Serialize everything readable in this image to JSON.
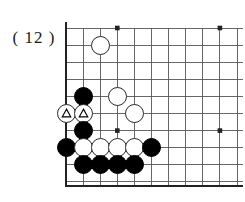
{
  "figure": {
    "label": "( 12 )",
    "type": "go-board-diagram"
  },
  "board": {
    "size_label": "19x19",
    "visible_cols": 11,
    "visible_rows": 10,
    "shows_corner": "bottom-left",
    "line_color": "#555555",
    "edge_color": "#222222",
    "background_color": "#ffffff",
    "star_points": [
      {
        "col": 4,
        "row": 1
      },
      {
        "col": 10,
        "row": 1
      },
      {
        "col": 4,
        "row": 7
      },
      {
        "col": 10,
        "row": 7
      }
    ],
    "stones": [
      {
        "col": 3,
        "row": 2,
        "color": "white",
        "mark": "none"
      },
      {
        "col": 2,
        "row": 5,
        "color": "black",
        "mark": "none"
      },
      {
        "col": 4,
        "row": 5,
        "color": "white",
        "mark": "none"
      },
      {
        "col": 1,
        "row": 6,
        "color": "white",
        "mark": "triangle"
      },
      {
        "col": 2,
        "row": 6,
        "color": "white",
        "mark": "triangle"
      },
      {
        "col": 5,
        "row": 6,
        "color": "white",
        "mark": "none"
      },
      {
        "col": 2,
        "row": 7,
        "color": "black",
        "mark": "none"
      },
      {
        "col": 1,
        "row": 8,
        "color": "black",
        "mark": "none"
      },
      {
        "col": 2,
        "row": 8,
        "color": "white",
        "mark": "none"
      },
      {
        "col": 3,
        "row": 8,
        "color": "white",
        "mark": "none"
      },
      {
        "col": 4,
        "row": 8,
        "color": "white",
        "mark": "none"
      },
      {
        "col": 5,
        "row": 8,
        "color": "white",
        "mark": "none"
      },
      {
        "col": 6,
        "row": 8,
        "color": "black",
        "mark": "none"
      },
      {
        "col": 2,
        "row": 9,
        "color": "black",
        "mark": "none"
      },
      {
        "col": 3,
        "row": 9,
        "color": "black",
        "mark": "none"
      },
      {
        "col": 4,
        "row": 9,
        "color": "black",
        "mark": "none"
      },
      {
        "col": 5,
        "row": 9,
        "color": "black",
        "mark": "none"
      }
    ]
  },
  "geometry": {
    "origin_x": 6,
    "origin_y": 12,
    "spacing": 17.1,
    "cols": 11,
    "rows": 10,
    "bottom_edge_y": 170,
    "left_edge_x": 6
  }
}
